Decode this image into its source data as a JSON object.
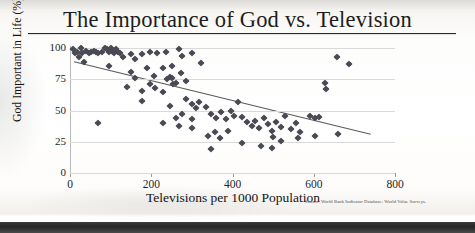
{
  "page": {
    "title": "The Importance of God vs. Television"
  },
  "chart_data": {
    "type": "scatter",
    "title": "The Importance of God vs. Television",
    "xlabel": "Televisions per 1000 Population",
    "ylabel": "God Important in Life (%)",
    "source": "Source: World Bank Indicator Database; World Value Surveys.",
    "xlim": [
      0,
      800
    ],
    "ylim": [
      0,
      100
    ],
    "xticks": [
      0,
      200,
      400,
      600,
      800
    ],
    "yticks": [
      0,
      25,
      50,
      75,
      100
    ],
    "xtick_labels": [
      "0",
      "200",
      "400",
      "600",
      "800"
    ],
    "ytick_labels": [
      "0",
      "25",
      "50",
      "75",
      "100"
    ],
    "grid": "horizontal",
    "legend": "none",
    "marker": "diamond",
    "marker_color": "#4a4a54",
    "trendline": {
      "type": "linear",
      "color": "#5a5a5a",
      "x_start": 10,
      "y_start": 89,
      "x_end": 740,
      "y_end": 31
    },
    "points": [
      {
        "x": 8,
        "y": 99
      },
      {
        "x": 12,
        "y": 96
      },
      {
        "x": 18,
        "y": 97
      },
      {
        "x": 22,
        "y": 93
      },
      {
        "x": 26,
        "y": 100
      },
      {
        "x": 30,
        "y": 96
      },
      {
        "x": 34,
        "y": 89
      },
      {
        "x": 40,
        "y": 98
      },
      {
        "x": 46,
        "y": 96
      },
      {
        "x": 52,
        "y": 97
      },
      {
        "x": 58,
        "y": 98
      },
      {
        "x": 64,
        "y": 97
      },
      {
        "x": 70,
        "y": 96
      },
      {
        "x": 78,
        "y": 97
      },
      {
        "x": 86,
        "y": 100
      },
      {
        "x": 92,
        "y": 99
      },
      {
        "x": 96,
        "y": 97
      },
      {
        "x": 100,
        "y": 100
      },
      {
        "x": 104,
        "y": 98
      },
      {
        "x": 108,
        "y": 96
      },
      {
        "x": 112,
        "y": 99
      },
      {
        "x": 118,
        "y": 97
      },
      {
        "x": 124,
        "y": 96
      },
      {
        "x": 130,
        "y": 93
      },
      {
        "x": 96,
        "y": 86
      },
      {
        "x": 150,
        "y": 95
      },
      {
        "x": 160,
        "y": 91
      },
      {
        "x": 176,
        "y": 95
      },
      {
        "x": 196,
        "y": 97
      },
      {
        "x": 214,
        "y": 96
      },
      {
        "x": 236,
        "y": 97
      },
      {
        "x": 250,
        "y": 86
      },
      {
        "x": 268,
        "y": 99
      },
      {
        "x": 276,
        "y": 94
      },
      {
        "x": 300,
        "y": 96
      },
      {
        "x": 322,
        "y": 88
      },
      {
        "x": 150,
        "y": 81
      },
      {
        "x": 190,
        "y": 84
      },
      {
        "x": 206,
        "y": 78
      },
      {
        "x": 238,
        "y": 75
      },
      {
        "x": 246,
        "y": 77
      },
      {
        "x": 252,
        "y": 76
      },
      {
        "x": 262,
        "y": 72
      },
      {
        "x": 272,
        "y": 80
      },
      {
        "x": 286,
        "y": 74
      },
      {
        "x": 140,
        "y": 69
      },
      {
        "x": 176,
        "y": 66
      },
      {
        "x": 208,
        "y": 68
      },
      {
        "x": 228,
        "y": 65
      },
      {
        "x": 254,
        "y": 71
      },
      {
        "x": 178,
        "y": 58
      },
      {
        "x": 246,
        "y": 54
      },
      {
        "x": 286,
        "y": 59
      },
      {
        "x": 300,
        "y": 55
      },
      {
        "x": 310,
        "y": 52
      },
      {
        "x": 318,
        "y": 57
      },
      {
        "x": 334,
        "y": 53
      },
      {
        "x": 348,
        "y": 47
      },
      {
        "x": 360,
        "y": 44
      },
      {
        "x": 372,
        "y": 49
      },
      {
        "x": 384,
        "y": 43
      },
      {
        "x": 396,
        "y": 50
      },
      {
        "x": 404,
        "y": 46
      },
      {
        "x": 228,
        "y": 40
      },
      {
        "x": 268,
        "y": 38
      },
      {
        "x": 300,
        "y": 36
      },
      {
        "x": 340,
        "y": 30
      },
      {
        "x": 356,
        "y": 33
      },
      {
        "x": 368,
        "y": 28
      },
      {
        "x": 390,
        "y": 34
      },
      {
        "x": 414,
        "y": 57
      },
      {
        "x": 424,
        "y": 45
      },
      {
        "x": 436,
        "y": 41
      },
      {
        "x": 448,
        "y": 38
      },
      {
        "x": 456,
        "y": 42
      },
      {
        "x": 466,
        "y": 36
      },
      {
        "x": 478,
        "y": 44
      },
      {
        "x": 488,
        "y": 39
      },
      {
        "x": 498,
        "y": 34
      },
      {
        "x": 508,
        "y": 41
      },
      {
        "x": 520,
        "y": 37
      },
      {
        "x": 530,
        "y": 46
      },
      {
        "x": 544,
        "y": 35
      },
      {
        "x": 556,
        "y": 40
      },
      {
        "x": 566,
        "y": 33
      },
      {
        "x": 500,
        "y": 29
      },
      {
        "x": 520,
        "y": 26
      },
      {
        "x": 560,
        "y": 28
      },
      {
        "x": 424,
        "y": 24
      },
      {
        "x": 470,
        "y": 22
      },
      {
        "x": 498,
        "y": 20
      },
      {
        "x": 346,
        "y": 19
      },
      {
        "x": 590,
        "y": 46
      },
      {
        "x": 604,
        "y": 44
      },
      {
        "x": 612,
        "y": 45
      },
      {
        "x": 628,
        "y": 72
      },
      {
        "x": 630,
        "y": 67
      },
      {
        "x": 656,
        "y": 93
      },
      {
        "x": 686,
        "y": 87
      },
      {
        "x": 660,
        "y": 31
      },
      {
        "x": 604,
        "y": 30
      },
      {
        "x": 70,
        "y": 40
      },
      {
        "x": 228,
        "y": 84
      },
      {
        "x": 196,
        "y": 71
      },
      {
        "x": 160,
        "y": 76
      },
      {
        "x": 300,
        "y": 43
      },
      {
        "x": 276,
        "y": 47
      },
      {
        "x": 262,
        "y": 44
      }
    ]
  }
}
